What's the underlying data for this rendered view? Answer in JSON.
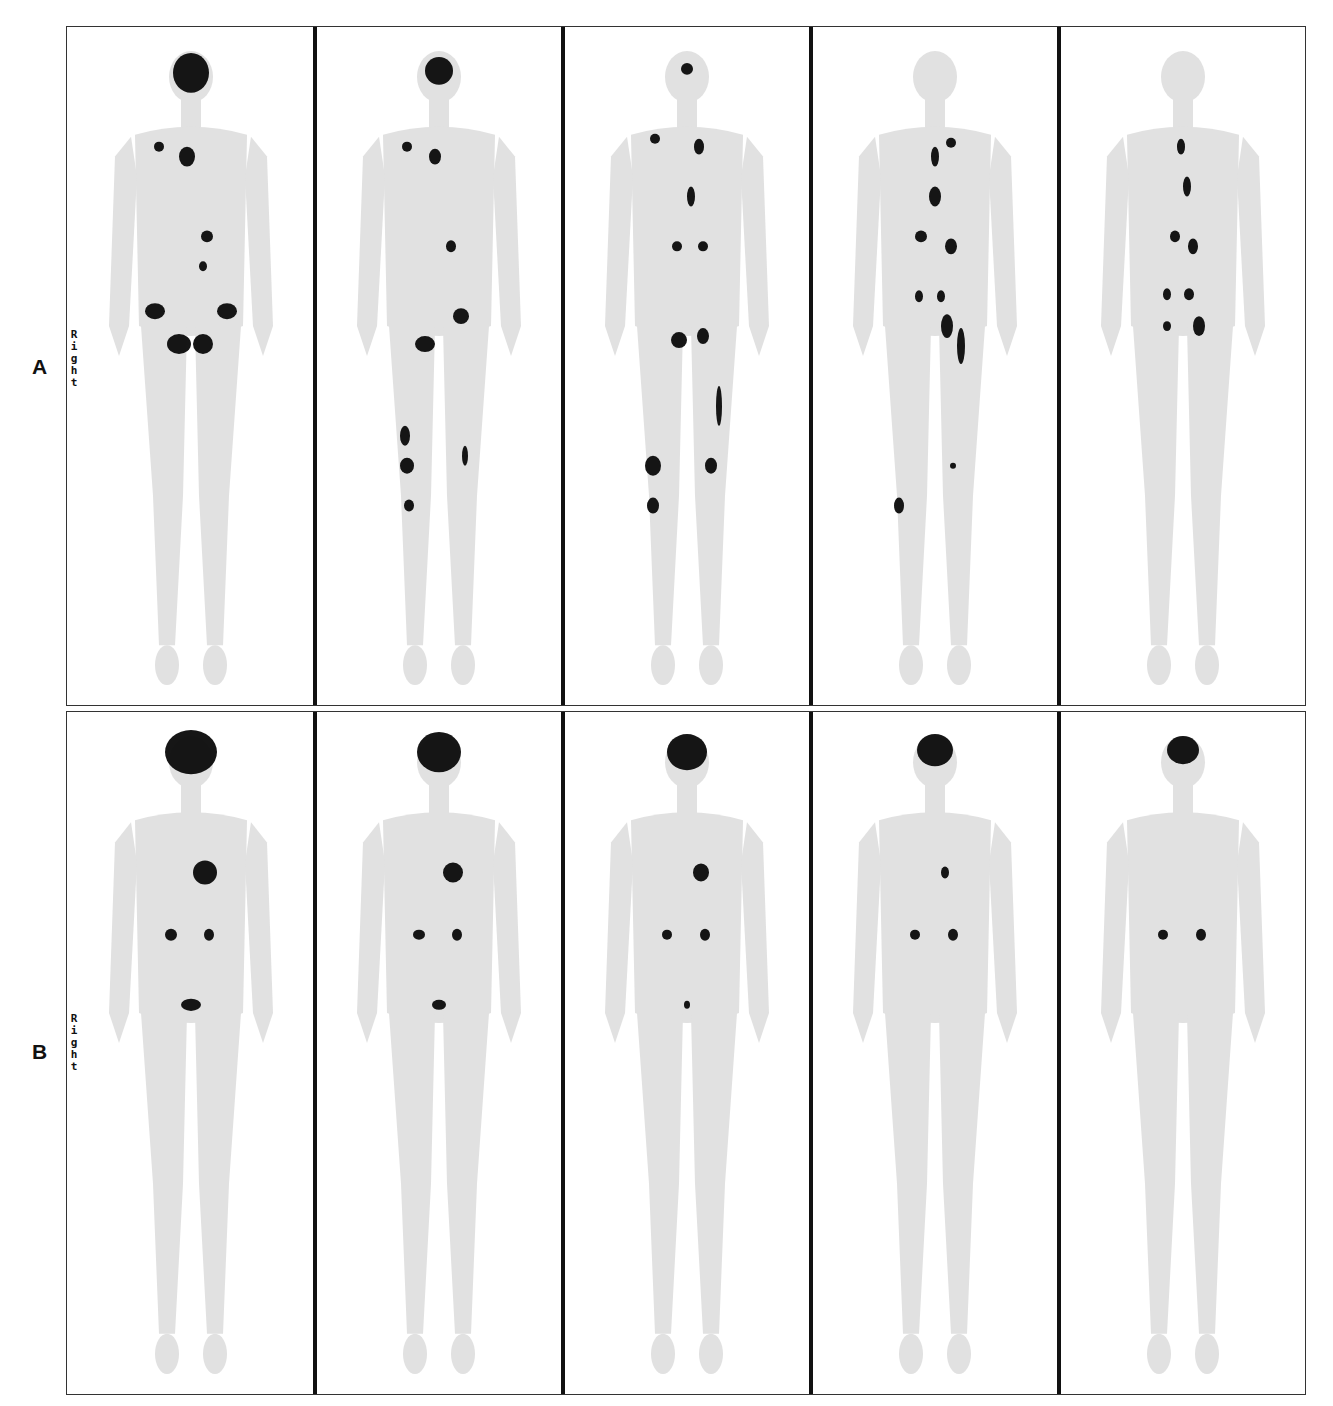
{
  "figure": {
    "rows": [
      {
        "label": "A",
        "orientation_label": "Right",
        "panels": [
          {
            "index": 1,
            "description": "whole-body scan, intense brain uptake, multiple skeletal lesions (pelvis, sternum, spine)",
            "intensity": 1.0
          },
          {
            "index": 2,
            "description": "whole-body scan, reduced brain uptake, lesions in pelvis, femur, knee",
            "intensity": 0.85
          },
          {
            "index": 3,
            "description": "whole-body scan, faint brain uptake, lesions in spine, femur, knees",
            "intensity": 0.7
          },
          {
            "index": 4,
            "description": "whole-body scan, minimal brain uptake, spine and pelvis lesions, tibia lesion",
            "intensity": 0.55
          },
          {
            "index": 5,
            "description": "whole-body scan, minimal brain uptake, residual spine and pelvis lesions",
            "intensity": 0.45
          }
        ]
      },
      {
        "label": "B",
        "orientation_label": "Right",
        "panels": [
          {
            "index": 1,
            "description": "whole-body scan, intense brain, heart, kidneys and bladder uptake",
            "intensity": 1.0
          },
          {
            "index": 2,
            "description": "whole-body scan, brain, heart, kidneys and bladder uptake",
            "intensity": 0.9
          },
          {
            "index": 3,
            "description": "whole-body scan, brain, heart, kidneys uptake, faint bladder",
            "intensity": 0.8
          },
          {
            "index": 4,
            "description": "whole-body scan, smaller brain, faint heart, kidneys",
            "intensity": 0.7
          },
          {
            "index": 5,
            "description": "whole-body scan, smaller brain, kidneys, faint heart",
            "intensity": 0.6
          }
        ]
      }
    ],
    "colors": {
      "background": "#ffffff",
      "frame": "#333333",
      "divider": "#111111",
      "body_tint": "#c9c9c9",
      "uptake": "#0a0a0a"
    }
  }
}
